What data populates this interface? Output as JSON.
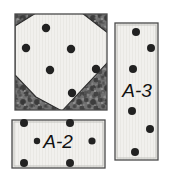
{
  "figure": {
    "caption": "",
    "background_color": "#ffffff",
    "specimens": [
      {
        "id": "specimen-square-top-left",
        "label": "",
        "shape": "square",
        "x": 15,
        "y": 14,
        "width": 92,
        "height": 96,
        "fill_color": "#f2f1ee",
        "texture_color": "#6e6e6e",
        "texture_dark": "#4a4a4a",
        "border_color": "#3a3a3a",
        "overlay_shape": "diamond-polygon",
        "overlay_color": "#f4f3f0",
        "overlay_points": "15,25 15,74 36,96 61,110 107,62 107,34 82,14 36,14",
        "dots": [
          {
            "cx": 46,
            "cy": 28,
            "r": 4.2
          },
          {
            "cx": 26,
            "cy": 48,
            "r": 4.2
          },
          {
            "cx": 71,
            "cy": 49,
            "r": 4.2
          },
          {
            "cx": 50,
            "cy": 70,
            "r": 4.2
          },
          {
            "cx": 96,
            "cy": 69,
            "r": 4.2
          },
          {
            "cx": 72,
            "cy": 93,
            "r": 4.2
          }
        ]
      },
      {
        "id": "specimen-rect-a3",
        "label": "A-3",
        "shape": "rectangle",
        "x": 115,
        "y": 23,
        "width": 43,
        "height": 137,
        "fill_color": "#efefec",
        "border_color": "#4a4a4a",
        "label_x": 137,
        "label_y": 92,
        "label_font_size": 19,
        "dots": [
          {
            "cx": 136,
            "cy": 32,
            "r": 4.0
          },
          {
            "cx": 151,
            "cy": 48,
            "r": 4.0
          },
          {
            "cx": 133,
            "cy": 69,
            "r": 4.0
          },
          {
            "cx": 132,
            "cy": 111,
            "r": 4.0
          },
          {
            "cx": 150,
            "cy": 129,
            "r": 4.0
          },
          {
            "cx": 135,
            "cy": 152,
            "r": 4.0
          }
        ]
      },
      {
        "id": "specimen-rect-a2",
        "label": "A-2",
        "shape": "rectangle",
        "x": 12,
        "y": 120,
        "width": 93,
        "height": 48,
        "fill_color": "#efefec",
        "border_color": "#4a4a4a",
        "label_x": 58,
        "label_y": 147,
        "label_font_size": 19,
        "dots": [
          {
            "cx": 24,
            "cy": 123,
            "r": 4.0
          },
          {
            "cx": 70,
            "cy": 123,
            "r": 4.0
          },
          {
            "cx": 37,
            "cy": 141,
            "r": 3.2
          },
          {
            "cx": 92,
            "cy": 141,
            "r": 3.6
          },
          {
            "cx": 24,
            "cy": 163,
            "r": 4.0
          },
          {
            "cx": 70,
            "cy": 163,
            "r": 4.0
          }
        ]
      }
    ],
    "colors": {
      "dot": "#222222",
      "panel_fill": "#efefec",
      "texture_mid": "#6a6a6a",
      "texture_dark": "#434343",
      "outline": "#454545",
      "page_background": "#ffffff"
    }
  }
}
